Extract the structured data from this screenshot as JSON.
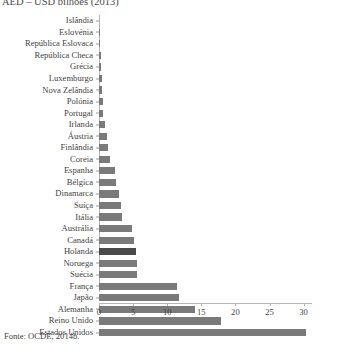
{
  "chart": {
    "title": "AED – USD bilhões (2013)",
    "source_note": "Fonte: OCDE, 2014b."
  },
  "chart_data": {
    "type": "bar",
    "orientation": "horizontal",
    "title": "AED – USD bilhões (2013)",
    "xlabel": "",
    "ylabel": "",
    "xlim": [
      0,
      31.5
    ],
    "grid": false,
    "legend": null,
    "xticks": [
      0,
      5,
      10,
      15,
      20,
      25,
      30
    ],
    "xtick_labels": [
      "0",
      "5",
      "10",
      "15",
      "20",
      "25",
      "30"
    ],
    "highlight_category": "Holanda",
    "bar_color": "#7a7a7a",
    "highlight_color": "#4a4a4a",
    "categories": [
      "Islândia",
      "Eslovénia",
      "República Eslovaca",
      "República Checa",
      "Grécia",
      "Luxemburgo",
      "Nova Zelândia",
      "Polónia",
      "Portugal",
      "Irlanda",
      "Áustria",
      "Finlândia",
      "Coreia",
      "Espanha",
      "Bélgica",
      "Dinamarca",
      "Suíça",
      "Itália",
      "Austrália",
      "Canadá",
      "Holanda",
      "Noruega",
      "Suécia",
      "França",
      "Japão",
      "Alemanha",
      "Reino Unido",
      "Estados Unidos"
    ],
    "values": [
      0.0,
      0.05,
      0.1,
      0.3,
      0.35,
      0.4,
      0.5,
      0.55,
      0.6,
      0.9,
      1.1,
      1.25,
      1.6,
      2.4,
      2.5,
      3.0,
      3.2,
      3.4,
      4.9,
      5.1,
      5.4,
      5.5,
      5.6,
      11.4,
      11.8,
      14.1,
      17.9,
      30.4
    ]
  }
}
